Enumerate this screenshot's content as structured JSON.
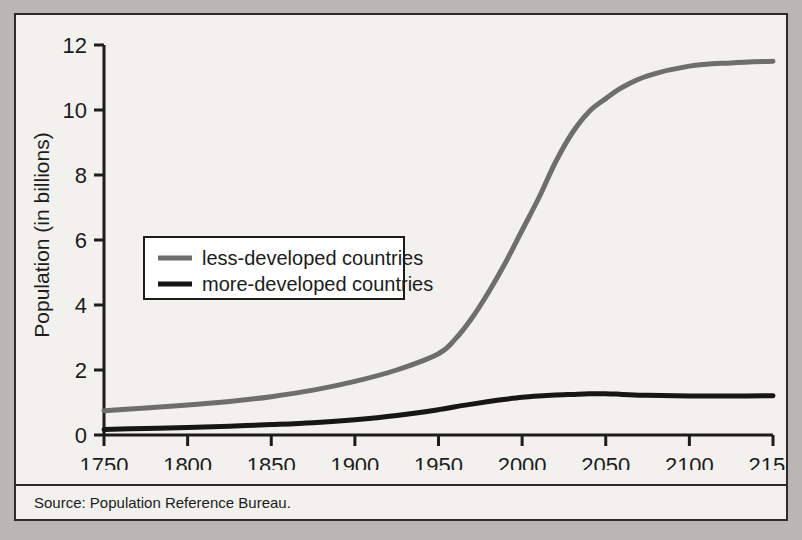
{
  "figure": {
    "source_note": "Source: Population Reference Bureau.",
    "frame_color": "#2b2b2b",
    "panel_color": "#f3f1ee",
    "outer_color": "#b9b7b4"
  },
  "axes": {
    "ylabel": "Population (in billions)",
    "xlabel": "",
    "yticks": [
      "0",
      "2",
      "4",
      "6",
      "8",
      "10",
      "12"
    ],
    "xticks": [
      "1750",
      "1800",
      "1850",
      "1900",
      "1950",
      "2000",
      "2050",
      "2100",
      "2150"
    ]
  },
  "legend": {
    "position": "center-left",
    "entries": [
      {
        "label": "less-developed countries",
        "color": "#6e6e6e"
      },
      {
        "label": "more-developed countries",
        "color": "#161616"
      }
    ]
  },
  "chart_data": {
    "type": "line",
    "title": "",
    "xlabel": "",
    "ylabel": "Population (in billions)",
    "xlim": [
      1750,
      2150
    ],
    "ylim": [
      0,
      12
    ],
    "xticks": [
      1750,
      1800,
      1850,
      1900,
      1950,
      2000,
      2050,
      2100,
      2150
    ],
    "yticks": [
      0,
      2,
      4,
      6,
      8,
      10,
      12
    ],
    "grid": false,
    "legend_position": "center-left",
    "x": [
      1750,
      1775,
      1800,
      1825,
      1850,
      1875,
      1900,
      1925,
      1950,
      1960,
      1970,
      1980,
      1990,
      2000,
      2010,
      2020,
      2030,
      2040,
      2050,
      2060,
      2075,
      2100,
      2125,
      2150
    ],
    "series": [
      {
        "name": "less-developed countries",
        "color": "#6e6e6e",
        "values": [
          0.75,
          0.83,
          0.92,
          1.03,
          1.18,
          1.38,
          1.65,
          2.0,
          2.5,
          2.95,
          3.6,
          4.4,
          5.3,
          6.3,
          7.3,
          8.4,
          9.3,
          9.95,
          10.35,
          10.7,
          11.05,
          11.35,
          11.45,
          11.5
        ]
      },
      {
        "name": "more-developed countries",
        "color": "#161616",
        "values": [
          0.17,
          0.2,
          0.23,
          0.27,
          0.32,
          0.38,
          0.47,
          0.6,
          0.78,
          0.87,
          0.95,
          1.03,
          1.1,
          1.16,
          1.2,
          1.23,
          1.25,
          1.27,
          1.27,
          1.25,
          1.22,
          1.2,
          1.2,
          1.21
        ]
      }
    ]
  }
}
